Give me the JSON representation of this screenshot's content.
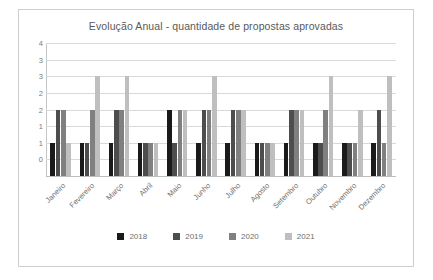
{
  "chart_data": {
    "type": "bar",
    "title": "Evolução Anual - quantidade de propostas aprovadas",
    "xlabel": "",
    "ylabel": "",
    "ylim": [
      0,
      4
    ],
    "ytick_values": [
      4,
      3.5,
      3,
      2.5,
      2,
      1.5,
      1,
      0.5,
      0
    ],
    "ytick_labels": [
      "4",
      "3",
      "3",
      "2",
      "2",
      "1",
      "1",
      "0"
    ],
    "grid": true,
    "legend_position": "bottom",
    "categories": [
      "Janeiro",
      "Fevereiro",
      "Março",
      "Abril",
      "Maio",
      "Junho",
      "Julho",
      "Agosto",
      "Setembro",
      "Outubro",
      "Novembro",
      "Dezembro"
    ],
    "series": [
      {
        "name": "2018",
        "color": "#1a1a1a",
        "values": [
          1,
          1,
          1,
          1,
          2,
          1,
          1,
          1,
          1,
          1,
          1,
          1
        ]
      },
      {
        "name": "2019",
        "color": "#4d4d4d",
        "values": [
          2,
          1,
          2,
          1,
          1,
          2,
          2,
          1,
          2,
          1,
          1,
          2
        ]
      },
      {
        "name": "2020",
        "color": "#808080",
        "values": [
          2,
          2,
          2,
          1,
          2,
          2,
          2,
          1,
          2,
          2,
          1,
          1
        ]
      },
      {
        "name": "2021",
        "color": "#bfbfbf",
        "values": [
          1,
          3,
          3,
          1,
          2,
          3,
          2,
          1,
          2,
          3,
          2,
          3
        ]
      }
    ]
  },
  "legend": {
    "items": [
      {
        "label": "2018"
      },
      {
        "label": "2019"
      },
      {
        "label": "2020"
      },
      {
        "label": "2021"
      }
    ]
  }
}
